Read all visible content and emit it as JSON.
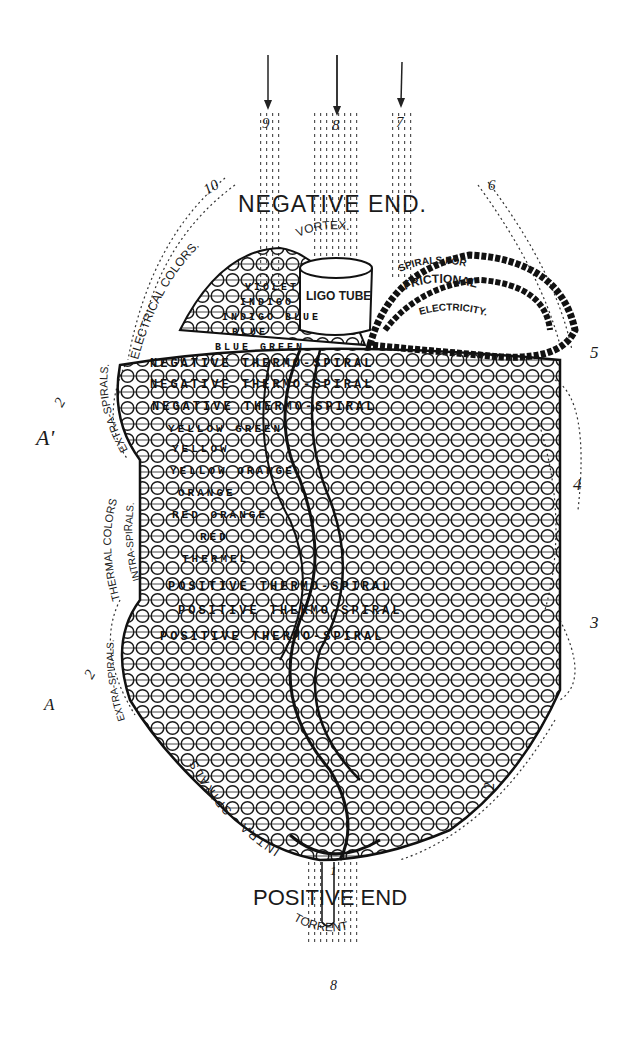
{
  "figure": {
    "title_top": "NEGATIVE END.",
    "title_bottom": "POSITIVE END",
    "vortex": "VORTEX.",
    "torrent": "TORRENT",
    "tube": "LIGO TUBE",
    "arc_labels": {
      "electrical_colors": "ELECTRICAL COLORS.",
      "spirals_for": "SPIRALS FOR",
      "frictional": "FRICTIONAL",
      "electricity": "ELECTRICITY.",
      "extra_spirals_upper": "EXTRA-SPIRALS.",
      "thermal_colors": "THERMAL COLORS",
      "intra_spirals_left": "INTRA-SPIRALS.",
      "extra_spirals_lower": "EXTRA-SPIRALS.",
      "intra_spirals_bottom": "INTRA - SPIRALS"
    },
    "coil_rows": [
      "VIOLET",
      "INDIGO",
      "INDIGO BLUE",
      "BLUE",
      "BLUE GREEN",
      "NEGATIVE THERMO-SPIRAL",
      "NEGATIVE THERMO-SPIRAL",
      "NEGATIVE THERMO-SPIRAL",
      "YELLOW GREEN",
      "YELLOW",
      "YELLOW ORANGE",
      "ORANGE",
      "RED ORANGE",
      "RED",
      "THERMEL",
      "POSITIVE THERMO-SPIRAL",
      "POSITIVE THERMO-SPIRAL",
      "POSITIVE THERMO-SPIRAL"
    ],
    "markers": {
      "n9": "9",
      "n8_top": "8",
      "n7": "7",
      "n10": "10",
      "n6": "6",
      "n5": "5",
      "n4": "4",
      "n3": "3",
      "n2_right": "2",
      "n2_upper_left": "2",
      "n2_lower_left": "2",
      "n8_bottom": "8",
      "n1": "1",
      "a_prime": "A'",
      "a": "A"
    },
    "colors": {
      "ink": "#1a1a1a",
      "paper": "#ffffff"
    }
  }
}
